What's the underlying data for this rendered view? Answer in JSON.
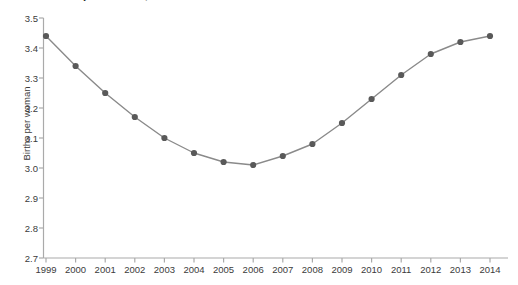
{
  "chart_data": {
    "type": "line",
    "title": "Births per woman, 1999-2014",
    "xlabel": "",
    "ylabel": "Births per woman",
    "categories": [
      1999,
      2000,
      2001,
      2002,
      2003,
      2004,
      2005,
      2006,
      2007,
      2008,
      2009,
      2010,
      2011,
      2012,
      2013,
      2014
    ],
    "values": [
      3.44,
      3.34,
      3.25,
      3.17,
      3.1,
      3.05,
      3.02,
      3.01,
      3.04,
      3.08,
      3.15,
      3.23,
      3.31,
      3.38,
      3.42,
      3.44
    ],
    "xlim": [
      1999,
      2014
    ],
    "ylim": [
      2.7,
      3.5
    ],
    "y_ticks": [
      "2.7",
      "2.8",
      "2.9",
      "3.0",
      "3.1",
      "3.2",
      "3.3",
      "3.4",
      "3.5"
    ],
    "y_tick_values": [
      2.7,
      2.8,
      2.9,
      3.0,
      3.1,
      3.2,
      3.3,
      3.4,
      3.5
    ],
    "x_ticks": [
      "1999",
      "2000",
      "2001",
      "2002",
      "2003",
      "2004",
      "2005",
      "2006",
      "2007",
      "2008",
      "2009",
      "2010",
      "2011",
      "2012",
      "2013",
      "2014"
    ],
    "grid": false,
    "legend": "none",
    "series": [
      {
        "name": "Births per woman",
        "line_color": "#8a8a8a",
        "marker_color": "#595959",
        "values": [
          3.44,
          3.34,
          3.25,
          3.17,
          3.1,
          3.05,
          3.02,
          3.01,
          3.04,
          3.08,
          3.15,
          3.23,
          3.31,
          3.38,
          3.42,
          3.44
        ]
      }
    ],
    "colors": {
      "axis": "#aaaaaa",
      "line": "#8a8a8a",
      "marker": "#595959",
      "text": "#3b3b3b",
      "background": "#ffffff"
    }
  }
}
